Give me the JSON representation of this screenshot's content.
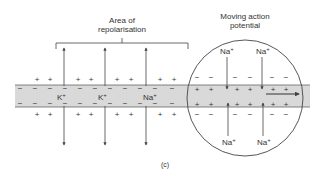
{
  "figure": {
    "caption": "(c)",
    "colors": {
      "membrane_fill": "#d9d9d9",
      "line": "#444444",
      "text": "#333333"
    }
  },
  "labels": {
    "repolarisation_line1": "Area of",
    "repolarisation_line2": "repolarisation",
    "action_potential_line1": "Moving action",
    "action_potential_line2": "potential"
  },
  "ions": {
    "k1": "K",
    "k2": "K",
    "na_mid": "Na",
    "na_top_left": "Na",
    "na_top_right": "Na",
    "na_bottom_left": "Na",
    "na_bottom_right": "Na",
    "superscript": "+"
  },
  "charges": {
    "plus": "+",
    "minus": "−"
  }
}
